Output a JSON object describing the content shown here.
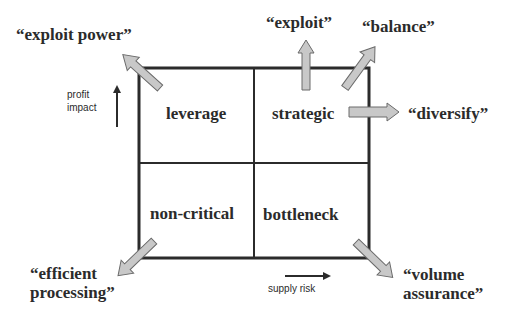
{
  "quadrants": {
    "top_left": "leverage",
    "top_right": "strategic",
    "bottom_left": "non-critical",
    "bottom_right": "bottleneck"
  },
  "axes": {
    "y_label_line1": "profit",
    "y_label_line2": "impact",
    "x_label": "supply risk"
  },
  "strategies": {
    "exploit_power": "“exploit power”",
    "exploit": "“exploit”",
    "balance": "“balance”",
    "diversify": "“diversify”",
    "efficient_line1": "“efficient",
    "efficient_line2": "processing”",
    "volume_line1": "“volume",
    "volume_line2": "assurance”"
  },
  "colors": {
    "grid_line": "#2b2b2b",
    "arrow_fill": "#c8c8c8",
    "arrow_stroke": "#6a6a6a"
  }
}
